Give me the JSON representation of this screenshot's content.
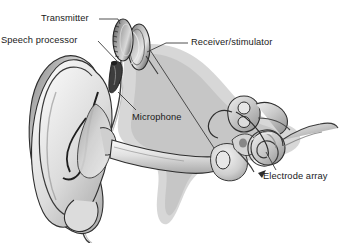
{
  "figure": {
    "background_color": "#ffffff",
    "width": 348,
    "height": 243,
    "style": "grayscale medical line illustration with airbrush shading"
  },
  "labels": {
    "transmitter": "Transmitter",
    "speech_processor": "Speech processor",
    "receiver_stimulator": "Receiver/stimulator",
    "microphone": "Microphone",
    "electrode_array": "Electrode array"
  },
  "parts": {
    "pinna": "outer-ear-pinna",
    "ear_canal": "external-auditory-canal",
    "earlobe": "earlobe",
    "cable": "speech-processor-cable",
    "transmitter_coil": "transmitter-coil-disc",
    "receiver_disc": "receiver-stimulator-disc",
    "microphone_body": "behind-the-ear-microphone",
    "cochlea": "cochlea-spiral",
    "semicircular_canals": "semicircular-canals",
    "ossicles": "middle-ear-ossicles",
    "tympanic_membrane": "eardrum",
    "electrode_wire": "electrode-array-wire",
    "head_tissue": "head-soft-tissue-silhouette"
  },
  "colors": {
    "ink": "#1a1a1a",
    "leader_line": "#3c3c3c",
    "tissue_light": "#e3e3e3",
    "tissue_mid": "#bdbdbd",
    "tissue_dark": "#8f8f8f",
    "device_dark": "#4a4a4a",
    "device_mid": "#9a9a9a",
    "device_light": "#d8d8d8",
    "background": "#ffffff"
  }
}
